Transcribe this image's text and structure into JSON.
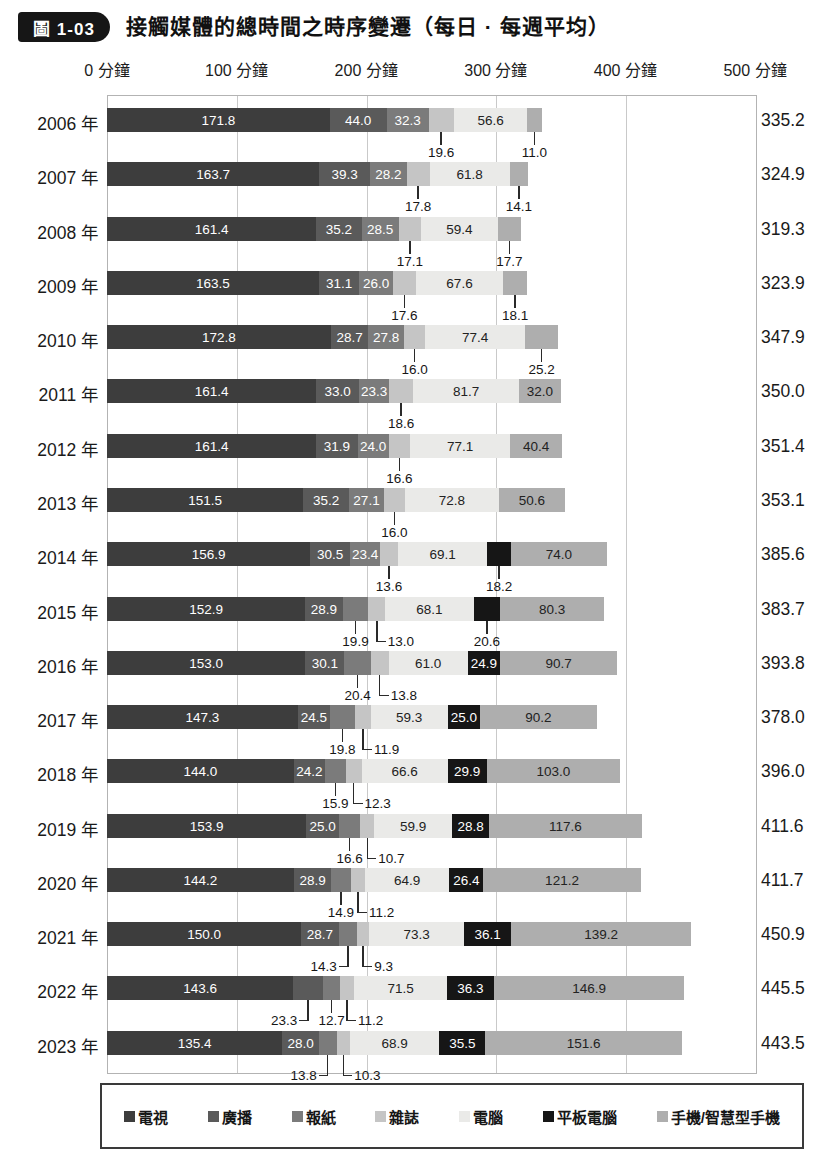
{
  "header": {
    "badge": "圖 1-03",
    "title": "接觸媒體的總時間之時序變遷（每日 · 每週平均）"
  },
  "chart_data": {
    "type": "bar",
    "orientation": "horizontal",
    "stacked": true,
    "title": "接觸媒體的總時間之時序變遷（每日 · 每週平均）",
    "unit": "分鐘",
    "xlim": [
      0,
      500
    ],
    "x_tick_step": 100,
    "x_ticks": [
      "0 分鐘",
      "100 分鐘",
      "200 分鐘",
      "300 分鐘",
      "400 分鐘",
      "500 分鐘"
    ],
    "grid": true,
    "legend_position": "bottom",
    "series_keys": [
      "tv",
      "radio",
      "newspaper",
      "magazine",
      "computer",
      "tablet",
      "mobile"
    ],
    "series_names": [
      "電視",
      "廣播",
      "報紙",
      "雜誌",
      "電腦",
      "平板電腦",
      "手機/智慧型手機"
    ],
    "colors": [
      "#3d3d3d",
      "#5a5a5a",
      "#7b7b7b",
      "#c5c5c5",
      "#eaeae8",
      "#161616",
      "#aeaeae"
    ],
    "value_label_colors": [
      "#ffffff",
      "#ffffff",
      "#ffffff",
      "#222222",
      "#222222",
      "#ffffff",
      "#222222"
    ],
    "rows": [
      {
        "year": "2006 年",
        "total": "335.2",
        "values": [
          171.8,
          44.0,
          32.3,
          19.6,
          56.6,
          null,
          11.0
        ],
        "label_modes": [
          "in",
          "in",
          "in",
          "tick",
          "in",
          null,
          "tick"
        ]
      },
      {
        "year": "2007 年",
        "total": "324.9",
        "values": [
          163.7,
          39.3,
          28.2,
          17.8,
          61.8,
          null,
          14.1
        ],
        "label_modes": [
          "in",
          "in",
          "in",
          "tick",
          "in",
          null,
          "tick"
        ]
      },
      {
        "year": "2008 年",
        "total": "319.3",
        "values": [
          161.4,
          35.2,
          28.5,
          17.1,
          59.4,
          null,
          17.7
        ],
        "label_modes": [
          "in",
          "in",
          "in",
          "tick",
          "in",
          null,
          "tick"
        ]
      },
      {
        "year": "2009 年",
        "total": "323.9",
        "values": [
          163.5,
          31.1,
          26.0,
          17.6,
          67.6,
          null,
          18.1
        ],
        "label_modes": [
          "in",
          "in",
          "in",
          "tick",
          "in",
          null,
          "tick"
        ]
      },
      {
        "year": "2010 年",
        "total": "347.9",
        "values": [
          172.8,
          28.7,
          27.8,
          16.0,
          77.4,
          null,
          25.2
        ],
        "label_modes": [
          "in",
          "in",
          "in",
          "tick",
          "in",
          null,
          "tick"
        ]
      },
      {
        "year": "2011 年",
        "total": "350.0",
        "values": [
          161.4,
          33.0,
          23.3,
          18.6,
          81.7,
          null,
          32.0
        ],
        "label_modes": [
          "in",
          "in",
          "in",
          "tick",
          "in",
          null,
          "in"
        ]
      },
      {
        "year": "2012 年",
        "total": "351.4",
        "values": [
          161.4,
          31.9,
          24.0,
          16.6,
          77.1,
          null,
          40.4
        ],
        "label_modes": [
          "in",
          "in",
          "in",
          "tick",
          "in",
          null,
          "in"
        ]
      },
      {
        "year": "2013 年",
        "total": "353.1",
        "values": [
          151.5,
          35.2,
          27.1,
          16.0,
          72.8,
          null,
          50.6
        ],
        "label_modes": [
          "in",
          "in",
          "in",
          "tick",
          "in",
          null,
          "in"
        ]
      },
      {
        "year": "2014 年",
        "total": "385.6",
        "values": [
          156.9,
          30.5,
          23.4,
          13.6,
          69.1,
          18.2,
          74.0
        ],
        "label_modes": [
          "in",
          "in",
          "in",
          "tick",
          "in",
          "tick",
          "in"
        ]
      },
      {
        "year": "2015 年",
        "total": "383.7",
        "values": [
          152.9,
          28.9,
          19.9,
          13.0,
          68.1,
          20.6,
          80.3
        ],
        "label_modes": [
          "in",
          "in",
          "tick",
          "left",
          "in",
          "tick",
          "in"
        ]
      },
      {
        "year": "2016 年",
        "total": "393.8",
        "values": [
          153.0,
          30.1,
          20.4,
          13.8,
          61.0,
          24.9,
          90.7
        ],
        "label_modes": [
          "in",
          "in",
          "tick",
          "left",
          "in",
          "in",
          "in"
        ]
      },
      {
        "year": "2017 年",
        "total": "378.0",
        "values": [
          147.3,
          24.5,
          19.8,
          11.9,
          59.3,
          25.0,
          90.2
        ],
        "label_modes": [
          "in",
          "in",
          "tick",
          "left",
          "in",
          "in",
          "in"
        ]
      },
      {
        "year": "2018 年",
        "total": "396.0",
        "values": [
          144.0,
          24.2,
          15.9,
          12.3,
          66.6,
          29.9,
          103.0
        ],
        "label_modes": [
          "in",
          "in",
          "tick",
          "left",
          "in",
          "in",
          "in"
        ]
      },
      {
        "year": "2019 年",
        "total": "411.6",
        "values": [
          153.9,
          25.0,
          16.6,
          10.7,
          59.9,
          28.8,
          117.6
        ],
        "label_modes": [
          "in",
          "in",
          "tick",
          "left",
          "in",
          "in",
          "in"
        ]
      },
      {
        "year": "2020 年",
        "total": "411.7",
        "values": [
          144.2,
          28.9,
          14.9,
          11.2,
          64.9,
          26.4,
          121.2
        ],
        "label_modes": [
          "in",
          "in",
          "tick",
          "left",
          "in",
          "in",
          "in"
        ]
      },
      {
        "year": "2021 年",
        "total": "450.9",
        "values": [
          150.0,
          28.7,
          14.3,
          9.3,
          73.3,
          36.1,
          139.2
        ],
        "label_modes": [
          "in",
          "in",
          "right",
          "left",
          "in",
          "in",
          "in"
        ]
      },
      {
        "year": "2022 年",
        "total": "445.5",
        "values": [
          143.6,
          23.3,
          12.7,
          11.2,
          71.5,
          36.3,
          146.9
        ],
        "label_modes": [
          "in",
          "right",
          "tick",
          "left",
          "in",
          "in",
          "in"
        ]
      },
      {
        "year": "2023 年",
        "total": "443.5",
        "values": [
          135.4,
          28.0,
          13.8,
          10.3,
          68.9,
          35.5,
          151.6
        ],
        "label_modes": [
          "in",
          "in",
          "right",
          "left",
          "in",
          "in",
          "in"
        ]
      }
    ]
  },
  "legend": {
    "items": [
      {
        "key": "tv",
        "label": "電視"
      },
      {
        "key": "radio",
        "label": "廣播"
      },
      {
        "key": "newspaper",
        "label": "報紙"
      },
      {
        "key": "magazine",
        "label": "雜誌"
      },
      {
        "key": "computer",
        "label": "電腦"
      },
      {
        "key": "tablet",
        "label": "平板電腦"
      },
      {
        "key": "mobile",
        "label": "手機/智慧型手機"
      }
    ]
  }
}
